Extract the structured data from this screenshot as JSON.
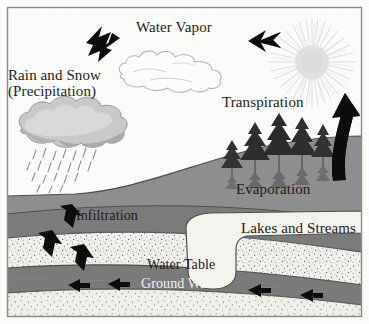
{
  "diagram": {
    "type": "hydrologic-cycle-cross-section",
    "canvas": {
      "width": 369,
      "height": 324
    },
    "border_color": "#8a8a8a",
    "background_color": "#fbfbfa"
  },
  "labels": {
    "rain_snow_line1": "Rain and Snow",
    "rain_snow_line2": "(Precipitation)",
    "water_vapor": "Water Vapor",
    "transpiration": "Transpiration",
    "evaporation": "Evaporation",
    "infiltration": "Infiltration",
    "lakes_and_streams": "Lakes and Streams",
    "water_table": "Water Table",
    "ground_water": "Ground Water"
  },
  "colors": {
    "sky": "#fbfbfa",
    "upper_soil": "#8c8c8c",
    "lower_soil": "#787878",
    "ground_water_band": "#7a7a7a",
    "aquifer_stipple_base": "#f1f0ec",
    "lake_water": "#f4f2ec",
    "cloud_rain_light": "#c6c6c6",
    "cloud_rain_dark": "#9d9d9d",
    "cloud_vapor_outline": "#b9b9b9",
    "sun": "#e2e2e2",
    "arrow_black": "#0d0d0d",
    "tree_dark": "#2a2a2a",
    "tree_shadow": "#6f6f6f",
    "outline": "#4a4a4a",
    "text_dark": "#1b1b1b",
    "text_white": "#f2f2ef"
  },
  "elements": {
    "sun": {
      "name": "sun",
      "cx": 312,
      "cy": 62,
      "rays": 44
    },
    "vapor_cloud": {
      "name": "water-vapor-cloud",
      "filled": false
    },
    "rain_cloud": {
      "name": "rain-cloud",
      "filled": true,
      "has_raindrops": true,
      "raindrop_count": 22
    },
    "trees": {
      "name": "conifer-trees",
      "count": 5
    },
    "arrows": [
      {
        "name": "precipitation-arrow",
        "direction": "down-left"
      },
      {
        "name": "water-vapor-arrow",
        "direction": "left"
      },
      {
        "name": "evaporation-arrow",
        "direction": "up",
        "style": "large-curved"
      },
      {
        "name": "infiltration-arrow-1",
        "direction": "down"
      },
      {
        "name": "infiltration-arrow-2",
        "direction": "down-right"
      },
      {
        "name": "infiltration-arrow-3",
        "direction": "down-right"
      },
      {
        "name": "groundwater-flow-arrow-1",
        "direction": "right"
      },
      {
        "name": "groundwater-flow-arrow-2",
        "direction": "right"
      },
      {
        "name": "groundwater-flow-arrow-3",
        "direction": "right"
      },
      {
        "name": "groundwater-flow-arrow-4",
        "direction": "right"
      }
    ]
  }
}
